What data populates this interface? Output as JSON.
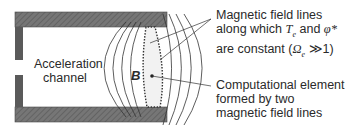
{
  "labels": {
    "channel": [
      "Acceleration",
      "channel"
    ],
    "field_symbol": "B",
    "field_lines_annotation": {
      "line1": "Magnetic field lines",
      "line2_prefix": "along which ",
      "line2_var1": "T",
      "line2_var1_sub": "e",
      "line2_mid": " and ",
      "line2_var2": "φ*",
      "line3_prefix": "are constant (",
      "line3_var": "Ω",
      "line3_var_sub": "e",
      "line3_suffix": " ≫1)"
    },
    "element_annotation": [
      "Computational element",
      "formed by two",
      "magnetic field lines"
    ]
  },
  "colors": {
    "wall_fill": "#6e6e6e",
    "wall_dark": "#4a4a4a",
    "line": "#333333"
  }
}
